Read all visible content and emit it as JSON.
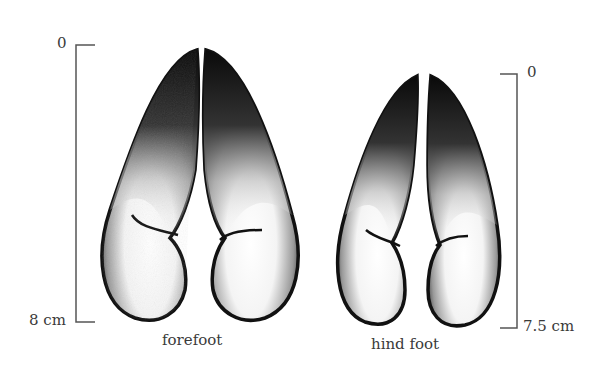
{
  "diagram": {
    "forefoot": {
      "caption": "forefoot",
      "scale_top": "0",
      "scale_bottom": "8 cm"
    },
    "hind_foot": {
      "caption": "hind foot",
      "scale_top": "0",
      "scale_bottom": "7.5 cm"
    }
  },
  "colors": {
    "ink": "#111111",
    "scale_line": "#555555",
    "background": "#ffffff"
  }
}
